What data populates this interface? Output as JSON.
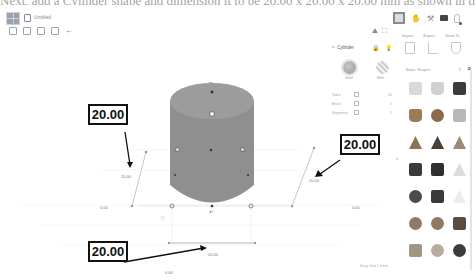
{
  "caption_fragment": "Next, add a Cylinder shape and dimension it to be 20.00 x 20.00 x 20.00 mm as shown in the figure below.",
  "header": {
    "doc_title": "Untitled",
    "edit_tools": [
      "copy-icon",
      "paste-icon",
      "duplicate-icon",
      "delete-icon",
      "undo-icon"
    ],
    "undo_glyph": "←"
  },
  "view_toolbar": {
    "items": [
      "3d-view-icon",
      "hand-icon",
      "pickaxe-icon",
      "briefcase-icon",
      "user-icon"
    ],
    "hand_glyph": "✋",
    "pick_glyph": "⚒"
  },
  "tool_tabs": {
    "icons": [
      "light-icon",
      "grid-icon"
    ],
    "labels": [
      "Import",
      "Export",
      "Send To"
    ]
  },
  "shape_panel": {
    "title": "Cylinder",
    "solid_label": "Solid",
    "hole_label": "Hole",
    "properties": [
      {
        "label": "Sides",
        "value": "20"
      },
      {
        "label": "Bevel",
        "value": "0"
      },
      {
        "label": "Segments",
        "value": "1"
      }
    ]
  },
  "sidebar": {
    "library_label": "Basic Shapes",
    "selector_glyph": "↕",
    "shapes": [
      {
        "name": "box",
        "color": "#d9d9d9"
      },
      {
        "name": "cylinder",
        "color": "#d0d0d0"
      },
      {
        "name": "box-dark",
        "color": "#3b3b3b"
      },
      {
        "name": "cylinder-brown",
        "color": "#9a7b55"
      },
      {
        "name": "sphere",
        "color": "#8a6a48"
      },
      {
        "name": "scribble",
        "color": "#b8b8b8"
      },
      {
        "name": "roof",
        "color": "#8c7356"
      },
      {
        "name": "cone",
        "color": "#4a3f38"
      },
      {
        "name": "round-roof",
        "color": "#9a8a7a"
      },
      {
        "name": "text",
        "color": "#3a3a3a"
      },
      {
        "name": "wedge",
        "color": "#2f2f2f"
      },
      {
        "name": "pyramid",
        "color": "#dcdcdc"
      },
      {
        "name": "half-sphere",
        "color": "#4f4a45"
      },
      {
        "name": "polygon",
        "color": "#3a3a3a"
      },
      {
        "name": "paraboloid",
        "color": "#ececec"
      },
      {
        "name": "torus",
        "color": "#8f7a66"
      },
      {
        "name": "tube",
        "color": "#8f7a66"
      },
      {
        "name": "heart",
        "color": "#5a4c40"
      },
      {
        "name": "star",
        "color": "#a39585"
      },
      {
        "name": "icosahedron",
        "color": "#b8ac9e"
      },
      {
        "name": "soccer-ball",
        "color": "#3c3c3c"
      }
    ]
  },
  "canvas": {
    "callouts": [
      {
        "id": "height",
        "text": "20.00"
      },
      {
        "id": "width",
        "text": "20.00"
      },
      {
        "id": "length",
        "text": "20.00"
      }
    ],
    "dim_labels": {
      "height_left": "20.00",
      "height_right": "20.00",
      "length_bottom": "20.00",
      "elevation_left": "0.00",
      "elevation_right": "0.00",
      "bottom_offset": "0.00"
    },
    "cylinder_color": "#8f8f8f",
    "cylinder_top_color": "#9c9c9c"
  },
  "status": {
    "snap_grid": "Snap Grid  1.0 mm"
  }
}
